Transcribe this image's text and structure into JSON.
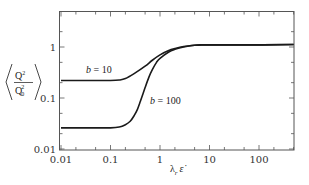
{
  "chart_data": {
    "type": "line",
    "title": "",
    "xlabel": "λ_r ε̇",
    "xlabel_main": "λ",
    "xlabel_sub": "r",
    "xlabel_tail": "ε̇",
    "ylabel": "⟨Q²/Q₀²⟩",
    "ylabel_num": "Q",
    "ylabel_num_sup": "2",
    "ylabel_den": "Q",
    "ylabel_den_sub": "0",
    "ylabel_den_sup": "2",
    "xscale": "log",
    "yscale": "log",
    "xlim": [
      0.01,
      500
    ],
    "ylim": [
      0.01,
      5
    ],
    "grid": false,
    "legend": "none (inline annotations)",
    "x_ticks": [
      0.01,
      0.1,
      1,
      10,
      100
    ],
    "x_tick_labels": [
      "0.01",
      "0.1",
      "1",
      "10",
      "100"
    ],
    "y_ticks": [
      0.01,
      0.1,
      1
    ],
    "y_tick_labels": [
      "0.01",
      "0.1",
      "1"
    ],
    "series": [
      {
        "name": "b = 10",
        "label": "b = 10",
        "x": [
          0.01,
          0.05,
          0.1,
          0.15,
          0.2,
          0.3,
          0.5,
          0.7,
          1,
          1.5,
          2,
          3,
          5,
          7,
          10,
          100,
          500
        ],
        "y": [
          0.22,
          0.22,
          0.22,
          0.225,
          0.24,
          0.3,
          0.42,
          0.55,
          0.7,
          0.85,
          0.93,
          1.02,
          1.08,
          1.1,
          1.1,
          1.1,
          1.12
        ]
      },
      {
        "name": "b = 100",
        "label": "b = 100",
        "x": [
          0.01,
          0.05,
          0.1,
          0.15,
          0.2,
          0.25,
          0.3,
          0.35,
          0.4,
          0.5,
          0.6,
          0.7,
          0.85,
          1,
          1.5,
          2,
          3,
          5,
          7,
          10,
          100,
          500
        ],
        "y": [
          0.026,
          0.026,
          0.026,
          0.027,
          0.03,
          0.035,
          0.045,
          0.06,
          0.085,
          0.16,
          0.26,
          0.36,
          0.5,
          0.6,
          0.8,
          0.9,
          1.0,
          1.08,
          1.1,
          1.1,
          1.1,
          1.12
        ]
      }
    ],
    "annotations": [
      {
        "text_italic": "b",
        "text_rest": " = 10",
        "near": "b=10 plateau, x≈0.05, above curve"
      },
      {
        "text_italic": "b",
        "text_rest": " = 100",
        "near": "b=100 steep rise, x≈0.6"
      }
    ]
  }
}
